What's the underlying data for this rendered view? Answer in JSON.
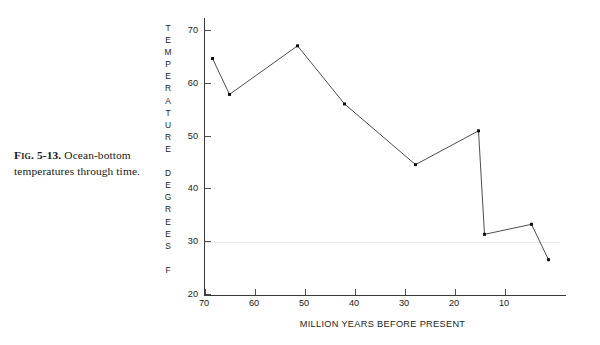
{
  "figure": {
    "caption_prefix": "Fig.",
    "caption_number": "5-13.",
    "caption_text": "Ocean-bottom temperatures through time."
  },
  "chart_data": {
    "type": "line",
    "title": "",
    "subtitle": "",
    "xlabel": "MILLION YEARS BEFORE PRESENT",
    "ylabel": "TEMPERATURE DEGREES F",
    "ylabel_lines": [
      "TEMPERATURE",
      "DEGREES",
      "F"
    ],
    "xlim": [
      70,
      0
    ],
    "ylim": [
      20,
      72
    ],
    "x_axis_reversed": true,
    "xticks": [
      70,
      60,
      50,
      40,
      30,
      20,
      10
    ],
    "yticks": [
      70,
      60,
      50,
      40,
      30,
      20
    ],
    "grid": false,
    "legend": "none",
    "marker": "square",
    "line_color": "#3a3a3a",
    "marker_color": "#111111",
    "axis_color": "#3a3a3a",
    "x": [
      68.4,
      65.0,
      51.4,
      42.0,
      27.8,
      15.2,
      14.0,
      4.6,
      1.2
    ],
    "y": [
      64.6,
      57.8,
      67.0,
      56.0,
      44.5,
      50.9,
      31.3,
      33.2,
      26.5
    ],
    "points": [
      {
        "x": 68.4,
        "y": 64.6
      },
      {
        "x": 65.0,
        "y": 57.8
      },
      {
        "x": 51.4,
        "y": 67.0
      },
      {
        "x": 42.0,
        "y": 56.0
      },
      {
        "x": 27.8,
        "y": 44.5
      },
      {
        "x": 15.2,
        "y": 50.9
      },
      {
        "x": 14.0,
        "y": 31.3
      },
      {
        "x": 4.6,
        "y": 33.2
      },
      {
        "x": 1.2,
        "y": 26.5
      }
    ]
  }
}
